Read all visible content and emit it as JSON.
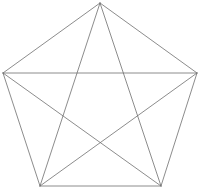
{
  "figure": {
    "name": "pentagram-in-pentagon",
    "background_color": "#ffffff",
    "canvas": {
      "width": 201,
      "height": 192
    },
    "stroke": {
      "color": "#6e6e6e",
      "width": 0.8
    },
    "vertices": [
      {
        "id": "top",
        "label": "A",
        "x": 100,
        "y": 3
      },
      {
        "id": "right",
        "label": "B",
        "x": 197,
        "y": 73
      },
      {
        "id": "bottom-right",
        "label": "C",
        "x": 161,
        "y": 186
      },
      {
        "id": "bottom-left",
        "label": "D",
        "x": 40,
        "y": 186
      },
      {
        "id": "left",
        "label": "E",
        "x": 3,
        "y": 73
      }
    ],
    "edges": [
      {
        "id": "edge-top-right",
        "from": "top",
        "to": "right"
      },
      {
        "id": "edge-right-bottomright",
        "from": "right",
        "to": "bottom-right"
      },
      {
        "id": "edge-bottomright-bottomleft",
        "from": "bottom-right",
        "to": "bottom-left"
      },
      {
        "id": "edge-bottomleft-left",
        "from": "bottom-left",
        "to": "left"
      },
      {
        "id": "edge-left-top",
        "from": "left",
        "to": "top"
      }
    ],
    "diagonals": [
      {
        "id": "diagonal-top-bottomright",
        "from": "top",
        "to": "bottom-right"
      },
      {
        "id": "diagonal-top-bottomleft",
        "from": "top",
        "to": "bottom-left"
      },
      {
        "id": "diagonal-right-bottomleft",
        "from": "right",
        "to": "bottom-left"
      },
      {
        "id": "diagonal-right-left",
        "from": "right",
        "to": "left"
      },
      {
        "id": "diagonal-bottomright-left",
        "from": "bottom-right",
        "to": "left"
      }
    ],
    "star_intersections": [
      {
        "id": "inner-top-left",
        "x": 60,
        "y": 117
      },
      {
        "id": "inner-top-right",
        "x": 140,
        "y": 117
      },
      {
        "id": "inner-bottom",
        "x": 100,
        "y": 144
      },
      {
        "id": "inner-upper-left",
        "x": 68,
        "y": 73
      },
      {
        "id": "inner-upper-right",
        "x": 132,
        "y": 73
      }
    ]
  }
}
